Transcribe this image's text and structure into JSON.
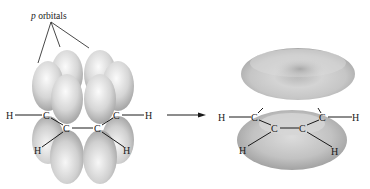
{
  "figure": {
    "label": {
      "italic": "p",
      "text": " orbitals"
    },
    "left_molecule": {
      "atoms": {
        "h_left": "H",
        "c1": "C",
        "c2": "C",
        "c3": "C",
        "c4": "C",
        "h_right": "H",
        "h_c2": "H",
        "h_c3": "H"
      }
    },
    "arrow": {
      "direction": "right"
    },
    "right_molecule": {
      "atoms": {
        "h_left": "H",
        "c1": "C",
        "c2": "C",
        "c3": "C",
        "c4": "C",
        "h_right": "H",
        "h_c2": "H",
        "h_c3": "H"
      }
    },
    "colors": {
      "orbital_light": "#f2f2f2",
      "orbital_mid": "#c8c8c8",
      "orbital_dark": "#9a9a9a",
      "text": "#1a1a1a"
    }
  }
}
